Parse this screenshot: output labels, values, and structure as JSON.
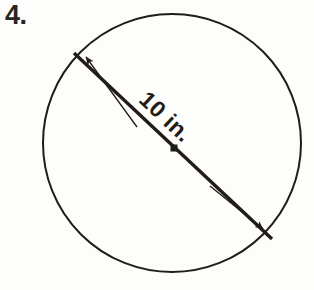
{
  "figure": {
    "kind": "geometry-diagram",
    "shape": "circle",
    "problem_number": "4.",
    "dimension_label": "10 in.",
    "measurement": {
      "quantity": "diameter",
      "value": 10,
      "unit": "in."
    },
    "colors": {
      "ink": "#2b2520",
      "line": "#211c18",
      "background": "#fdfdfc"
    },
    "circle": {
      "center_x": 172,
      "center_y": 143,
      "radius": 129,
      "stroke_width": 2
    },
    "diameter_line": {
      "x1": 74,
      "y1": 53,
      "x2": 272,
      "y2": 239,
      "stroke_width": 3.4
    },
    "center_dot": {
      "x": 174,
      "y": 148,
      "size": 7
    },
    "arrows": [
      {
        "name": "upper-left-dimension-arrow",
        "direction": "up-left",
        "x1": 137,
        "y1": 127,
        "x2": 84,
        "y2": 55
      },
      {
        "name": "lower-right-dimension-arrow",
        "direction": "down-right",
        "x1": 210,
        "y1": 186,
        "x2": 265,
        "y2": 231
      }
    ]
  }
}
